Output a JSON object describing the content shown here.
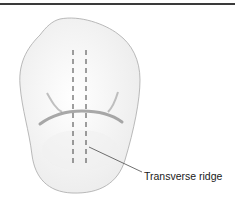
{
  "figure": {
    "labels": [
      {
        "text": "Transverse ridge"
      }
    ],
    "colors": {
      "outline": "#a8a8a8",
      "fill": "#f7f7f7",
      "groove": "#8c8c8c",
      "dashes": "#2a2a2a",
      "leader": "#333333",
      "rule": "#3a3a3a"
    }
  }
}
